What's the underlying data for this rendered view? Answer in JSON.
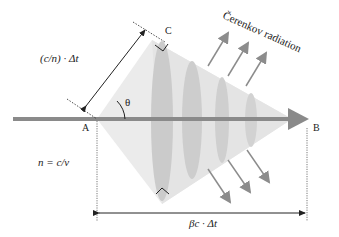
{
  "diagram": {
    "labels": {
      "cerenkov": "Čerenkov radiation",
      "slant_length": "(c/n) · Δt",
      "theta": "θ",
      "point_a": "A",
      "point_b": "B",
      "point_c": "C",
      "refractive_index": "n = c/v",
      "beam_length": "βc · Δt"
    },
    "colors": {
      "cone_fill": "#ebebeb",
      "ellipse_fill": "#c9c9c9",
      "beam": "#8a8a8a",
      "radiation_arrow": "#8c8c8c",
      "dimension_line": "#222222"
    },
    "geometry": {
      "beam_y": 119,
      "point_a_x": 97,
      "point_b_x": 292,
      "wavefront_count": 4,
      "radiation_arrow_count": 6
    }
  }
}
